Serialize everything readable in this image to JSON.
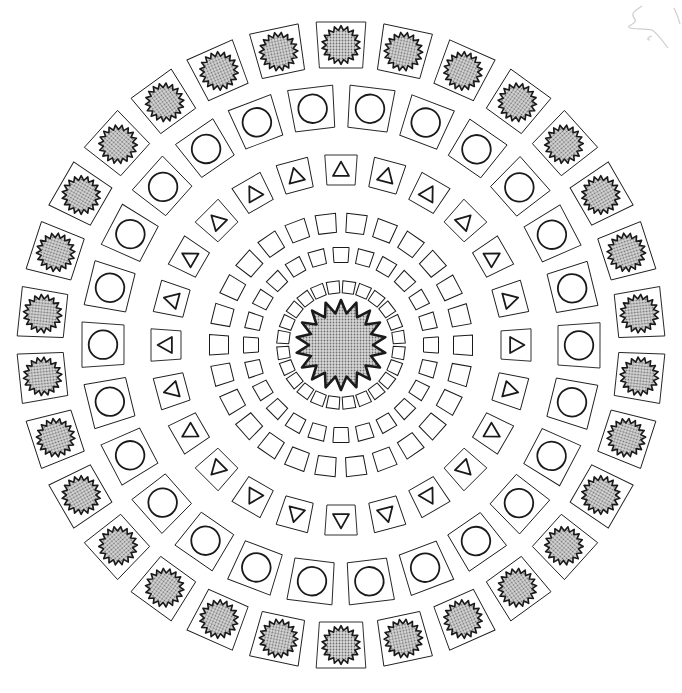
{
  "canvas": {
    "width": 682,
    "height": 693,
    "background": "#ffffff"
  },
  "center": {
    "x": 341,
    "y": 345
  },
  "colors": {
    "stroke": "#1a1a1a",
    "fill_shade": "#a8a8a8",
    "faint": "#c8c8c8"
  },
  "center_sun": {
    "radius_outer": 45,
    "radius_inner": 32,
    "points": 18
  },
  "rings": [
    {
      "name": "inner-square-ring",
      "shape": "square",
      "radius": 58,
      "count": 24,
      "size": 12,
      "offset_deg": 7.5
    },
    {
      "name": "middle-square-ring",
      "shape": "square",
      "radius": 90,
      "count": 24,
      "size": 15,
      "offset_deg": 0
    },
    {
      "name": "outer-square-ring",
      "shape": "square",
      "radius": 122,
      "count": 26,
      "size": 19,
      "offset_deg": 7
    },
    {
      "name": "triangle-ring",
      "shape": "triangle",
      "radius": 175,
      "count": 24,
      "size": 30,
      "offset_deg": 0
    },
    {
      "name": "circle-ring",
      "shape": "circle",
      "radius": 238,
      "count": 26,
      "size": 42,
      "offset_deg": 7
    },
    {
      "name": "sun-ring",
      "shape": "sun",
      "radius": 300,
      "count": 30,
      "size": 46,
      "offset_deg": 0
    }
  ]
}
